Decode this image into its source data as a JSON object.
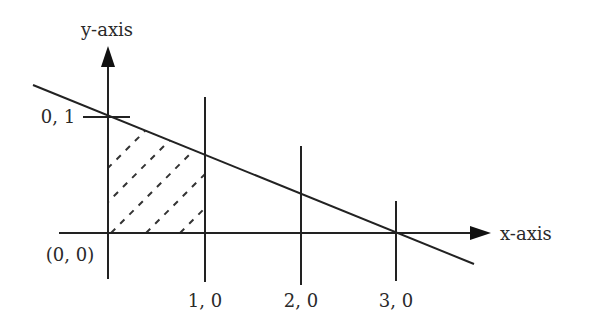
{
  "diagram": {
    "type": "coordinate-plane-shaded-region",
    "axes": {
      "x_label": "x-axis",
      "y_label": "y-axis",
      "origin_label": "(0, 0)"
    },
    "tick_labels": {
      "y1": "0, 1",
      "x1": "1, 0",
      "x2": "2, 0",
      "x3": "3, 0"
    },
    "line": {
      "description": "Line through (0,1) and (3,0)",
      "points": [
        [
          0,
          1
        ],
        [
          3,
          0
        ]
      ]
    },
    "shaded_region": {
      "description": "Region bounded by x=0, x=1, y=0 and the line",
      "pattern": "dashed diagonal hatch"
    },
    "colors": {
      "stroke": "#222222",
      "background": "#ffffff"
    }
  }
}
